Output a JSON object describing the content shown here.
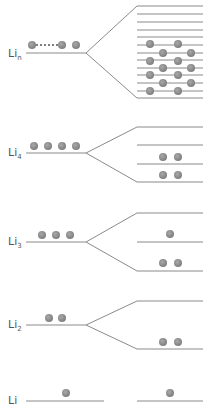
{
  "colors": {
    "line": "#8a8a8a",
    "ball": "#7c7c7c",
    "ball_highlight": "#a8a8a8",
    "label": "#555555"
  },
  "groups": [
    {
      "id": "li-n",
      "label": "Li",
      "subscript": "n",
      "label_xy": [
        8,
        58
      ],
      "atom_level": {
        "x1": 26,
        "x2": 86,
        "y": 53
      },
      "atom_balls": [
        [
          32,
          45
        ],
        [
          62,
          45
        ],
        [
          76,
          45
        ]
      ],
      "dotted_connector": {
        "x1": 37,
        "x2": 57,
        "y": 45
      },
      "branch_point": [
        86,
        53
      ],
      "top_branch_end": [
        137,
        6
      ],
      "bottom_branch_end": [
        137,
        98
      ],
      "mo_x": [
        137,
        203
      ],
      "mo_levels_y": [
        6,
        14,
        22,
        30,
        37,
        45,
        53,
        60,
        68,
        75,
        83,
        91,
        98
      ],
      "mo_balls": [
        [
          150,
          44
        ],
        [
          178,
          44
        ],
        [
          163,
          53
        ],
        [
          191,
          53
        ],
        [
          150,
          61
        ],
        [
          178,
          61
        ],
        [
          163,
          68
        ],
        [
          191,
          68
        ],
        [
          150,
          75
        ],
        [
          178,
          75
        ],
        [
          163,
          83
        ],
        [
          191,
          83
        ],
        [
          150,
          91
        ],
        [
          178,
          91
        ]
      ]
    },
    {
      "id": "li-4",
      "label": "Li",
      "subscript": "4",
      "label_xy": [
        8,
        157
      ],
      "atom_level": {
        "x1": 26,
        "x2": 86,
        "y": 153
      },
      "atom_balls": [
        [
          34,
          146
        ],
        [
          48,
          146
        ],
        [
          62,
          146
        ],
        [
          76,
          146
        ]
      ],
      "branch_point": [
        86,
        153
      ],
      "top_branch_end": [
        137,
        127
      ],
      "bottom_branch_end": [
        137,
        182
      ],
      "mo_x": [
        137,
        203
      ],
      "mo_levels_y": [
        127,
        145,
        164,
        182
      ],
      "mo_balls": [
        [
          163,
          157
        ],
        [
          178,
          157
        ],
        [
          163,
          175
        ],
        [
          178,
          175
        ]
      ]
    },
    {
      "id": "li-3",
      "label": "Li",
      "subscript": "3",
      "label_xy": [
        8,
        246
      ],
      "atom_level": {
        "x1": 26,
        "x2": 86,
        "y": 242
      },
      "atom_balls": [
        [
          42,
          235
        ],
        [
          56,
          235
        ],
        [
          70,
          235
        ]
      ],
      "branch_point": [
        86,
        242
      ],
      "top_branch_end": [
        137,
        213
      ],
      "bottom_branch_end": [
        137,
        271
      ],
      "mo_x": [
        137,
        203
      ],
      "mo_levels_y": [
        213,
        242,
        271
      ],
      "mo_balls": [
        [
          170,
          234
        ],
        [
          163,
          263
        ],
        [
          178,
          263
        ]
      ]
    },
    {
      "id": "li-2",
      "label": "Li",
      "subscript": "2",
      "label_xy": [
        8,
        329
      ],
      "atom_level": {
        "x1": 26,
        "x2": 86,
        "y": 325
      },
      "atom_balls": [
        [
          49,
          318
        ],
        [
          62,
          318
        ]
      ],
      "branch_point": [
        86,
        325
      ],
      "top_branch_end": [
        137,
        301
      ],
      "bottom_branch_end": [
        137,
        349
      ],
      "mo_x": [
        137,
        203
      ],
      "mo_levels_y": [
        301,
        349
      ],
      "mo_balls": [
        [
          163,
          342
        ],
        [
          178,
          342
        ]
      ]
    },
    {
      "id": "li",
      "label": "Li",
      "subscript": "",
      "label_xy": [
        8,
        405
      ],
      "atom_level": {
        "x1": 26,
        "x2": 104,
        "y": 401
      },
      "atom_balls": [
        [
          66,
          393
        ]
      ],
      "branch_point": null,
      "mo_x": [
        137,
        203
      ],
      "mo_levels_y": [
        401
      ],
      "mo_balls": [
        [
          170,
          393
        ]
      ]
    }
  ]
}
